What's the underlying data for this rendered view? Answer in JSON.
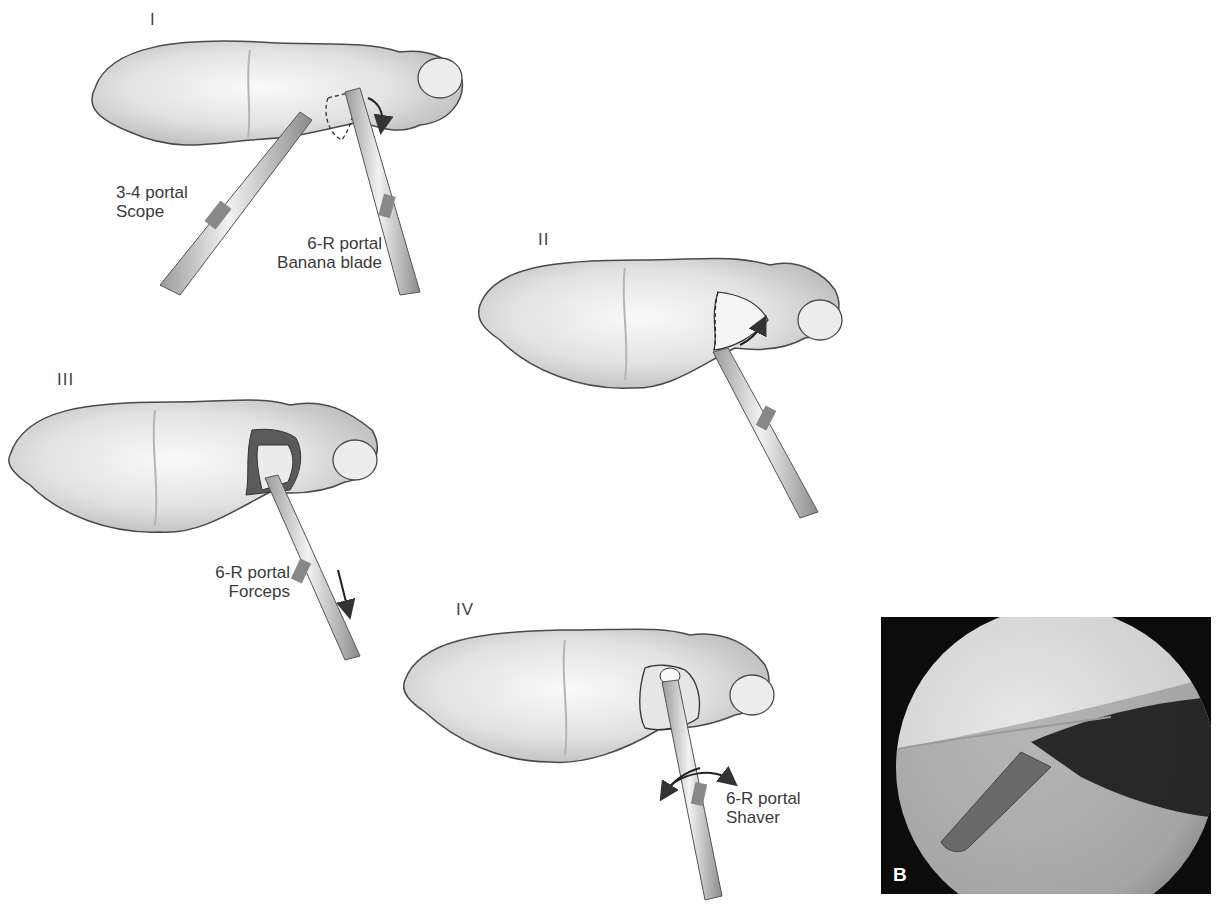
{
  "figure": {
    "panels": [
      {
        "id": "I",
        "numeral": "I",
        "labels": [
          {
            "line1": "3-4 portal",
            "line2": "Scope"
          },
          {
            "line1": "6-R portal",
            "line2": "Banana blade"
          }
        ]
      },
      {
        "id": "II",
        "numeral": "II",
        "labels": []
      },
      {
        "id": "III",
        "numeral": "III",
        "labels": [
          {
            "line1": "6-R portal",
            "line2": "Forceps"
          }
        ]
      },
      {
        "id": "IV",
        "numeral": "IV",
        "labels": [
          {
            "line1": "6-R portal",
            "line2": "Shaver"
          }
        ]
      }
    ],
    "photo": {
      "letter": "B"
    }
  },
  "colors": {
    "bone_fill": "#ececec",
    "bone_shade": "#c9c9c9",
    "outline": "#4a4a4a",
    "photo_bg": "#0c0c0c",
    "photo_light": "#d9d9d9"
  }
}
